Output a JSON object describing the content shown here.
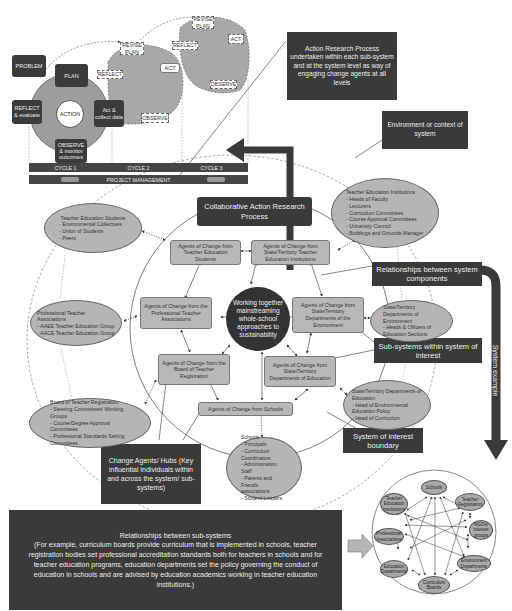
{
  "action_research_cycle": {
    "problem": "PROBLEM",
    "plan": "PLAN",
    "action": "ACTION",
    "act_collect": "Act & collect data",
    "reflect_evaluate": "REFLECT & evaluate",
    "observe_monitor": "OBSERVE & monitor outcomes",
    "cycle2": {
      "revise_plan": "REVISE PLAN",
      "reflect": "REFLECT",
      "act": "ACT",
      "observe": "OBSERVE"
    },
    "cycle3": {
      "revise_plan": "REVISE PLAN",
      "reflect": "REFLECT",
      "act": "ACT",
      "observe": "OBSERVE"
    },
    "cycles": [
      "CYCLE 1",
      "CYCLE 2",
      "CYCLE 3"
    ],
    "project_management": "PROJECT MANAGEMENT"
  },
  "callouts": {
    "action_research": "Action Research Process undertaken within each sub-system and at the system level as way of engaging change agents at all levels",
    "environment": "Environment or context of system",
    "relationships_components": "Relationships between system components",
    "subsystems": "Sub-systems within system of interest",
    "boundary": "System of interest boundary",
    "change_agents": "Change Agents/ Hubs (Key influential individuals within and across the system/ sub-systems)",
    "system_example": "System example",
    "relationships_subsystems_title": "Relationships between sub-systems",
    "relationships_subsystems_body": "(For example, curriculum boards provide curriculum that is implemented in schools, teacher registration bodies set professional accreditation standards both for teachers in schools and for teacher education programs, education departments set the policy governing the conduct of education in schools and are advised by education academics working in teacher education institutions.)"
  },
  "center": {
    "collaborative": "Collaborative Action Research Process",
    "core": "Working together mainstreaming whole-school approaches to sustainability"
  },
  "agents": {
    "students": "Agents of Change from Teacher Education Students",
    "institutions": "Agents of Change from State/Territory Teacher Education Institutions",
    "professional": "Agents of Change from the Professional Teacher Associations",
    "environment": "Agents of Change from State/Territory Departments of the Environment",
    "registration": "Agents of Change from the Board of Teacher Registration",
    "education": "Agents of Change from State/Territory Departments of Education",
    "schools": "Agents of Change from Schools"
  },
  "subsystems": {
    "students": {
      "title": "Teacher Education Students",
      "items": [
        "Environmental Collectives",
        "Union of Students",
        "Peers"
      ]
    },
    "institutions": {
      "title": "Teacher Education Institutions",
      "items": [
        "Heads of Faculty",
        "Lecturers",
        "Curriculum Committees",
        "Course Approval Committees",
        "University Council",
        "Buildings and Grounds Manager"
      ]
    },
    "professional": {
      "title": "Professional Teacher Associations",
      "items": [
        "AAEE Teacher Education Group",
        "AACE Teacher Education Group"
      ]
    },
    "environment": {
      "title": "State/Territory Departments of Environment",
      "items": [
        "Heads & Officers of Education Sections"
      ]
    },
    "registration": {
      "title": "Board of Teacher Registration",
      "items": [
        "Steering Committees/ Working Groups",
        "Course/Degree Approval Committees",
        "Professional Standards Setting Committees"
      ]
    },
    "education": {
      "title": "State/Territory Departments of Education",
      "items": [
        "Head of Environmental Education Policy",
        "Head of Curriculum"
      ]
    },
    "schools": {
      "title": "Schools",
      "items": [
        "Principals",
        "Curriculum Coordinators",
        "Administration Staff",
        "Parents and Friends associations",
        "Student Leaders"
      ]
    }
  },
  "system_example_nodes": {
    "schools": "Schools",
    "teacher_registration": "Teacher Registration",
    "ngo": "NGOs/ interest groups",
    "environment": "Environment Departments",
    "curriculum": "Curriculum Boards",
    "education": "Education Departments",
    "professional": "Professional Associations",
    "tei": "Teacher Education Institutions"
  }
}
